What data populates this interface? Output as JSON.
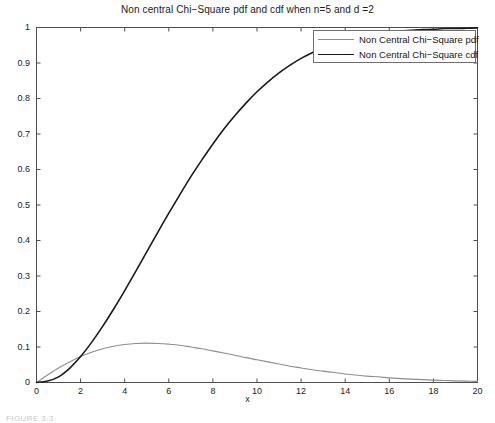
{
  "figure": {
    "caption": "FIGURE 3.3"
  },
  "chart_data": {
    "type": "line",
    "title": "Non central Chi−Square pdf and cdf when n=5 and d =2",
    "xlabel": "x",
    "ylabel": "",
    "xlim": [
      0,
      20
    ],
    "ylim": [
      0,
      1
    ],
    "grid": false,
    "legend_position": "top-right",
    "xticks": [
      0,
      2,
      4,
      6,
      8,
      10,
      12,
      14,
      16,
      18,
      20
    ],
    "xtick_labels": [
      "0",
      "2",
      "4",
      "6",
      "8",
      "10",
      "12",
      "14",
      "16",
      "18",
      "20"
    ],
    "yticks": [
      0,
      0.1,
      0.2,
      0.3,
      0.4,
      0.5,
      0.6,
      0.7,
      0.8,
      0.9,
      1
    ],
    "ytick_labels": [
      "0",
      "0.1",
      "0.2",
      "0.3",
      "0.4",
      "0.5",
      "0.6",
      "0.7",
      "0.8",
      "0.9",
      "1"
    ],
    "x": [
      0,
      0.5,
      1,
      1.5,
      2,
      2.5,
      3,
      3.5,
      4,
      4.5,
      5,
      5.5,
      6,
      6.5,
      7,
      7.5,
      8,
      8.5,
      9,
      9.5,
      10,
      10.5,
      11,
      11.5,
      12,
      12.5,
      13,
      13.5,
      14,
      14.5,
      15,
      15.5,
      16,
      16.5,
      17,
      17.5,
      18,
      18.5,
      19,
      19.5,
      20
    ],
    "series": [
      {
        "name": "Non Central Chi−Square pdf",
        "color": "#8c8c8c",
        "width": 1.1,
        "values": [
          0,
          0.021,
          0.041,
          0.058,
          0.073,
          0.085,
          0.095,
          0.102,
          0.107,
          0.11,
          0.111,
          0.11,
          0.108,
          0.105,
          0.1,
          0.095,
          0.089,
          0.083,
          0.077,
          0.07,
          0.064,
          0.058,
          0.052,
          0.046,
          0.041,
          0.036,
          0.032,
          0.028,
          0.024,
          0.021,
          0.018,
          0.016,
          0.013,
          0.011,
          0.0095,
          0.008,
          0.0067,
          0.0056,
          0.0046,
          0.0038,
          0.0031
        ]
      },
      {
        "name": "Non Central Chi−Square cdf",
        "color": "#1a1a1a",
        "width": 1.6,
        "values": [
          0,
          0.004,
          0.016,
          0.04,
          0.073,
          0.113,
          0.158,
          0.207,
          0.259,
          0.313,
          0.368,
          0.423,
          0.477,
          0.529,
          0.58,
          0.627,
          0.672,
          0.714,
          0.752,
          0.787,
          0.819,
          0.847,
          0.872,
          0.894,
          0.913,
          0.929,
          0.943,
          0.954,
          0.964,
          0.972,
          0.978,
          0.983,
          0.987,
          0.99,
          0.992,
          0.994,
          0.995,
          0.997,
          0.997,
          0.998,
          0.999
        ]
      }
    ]
  }
}
